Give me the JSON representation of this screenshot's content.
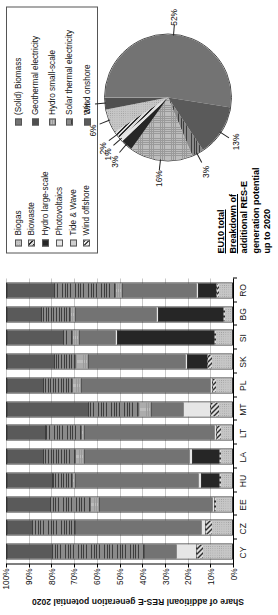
{
  "chart_data": [
    {
      "type": "bar",
      "subtype": "stacked-percentage-column",
      "title": "",
      "xlabel": "",
      "ylabel": "Share of additioanl RES-E generation potential 2020",
      "ylim": [
        0,
        100
      ],
      "ytick_labels": [
        "0%",
        "10%",
        "20%",
        "30%",
        "40%",
        "50%",
        "60%",
        "70%",
        "80%",
        "90%",
        "100%"
      ],
      "ytick_values": [
        0,
        10,
        20,
        30,
        40,
        50,
        60,
        70,
        80,
        90,
        100
      ],
      "grid": true,
      "legend_position": "top-right",
      "categories": [
        "CY",
        "CZ",
        "EE",
        "HU",
        "LA",
        "LT",
        "MT",
        "PL",
        "SK",
        "SI",
        "BG",
        "RO"
      ],
      "series": [
        {
          "name": "Biogas",
          "values": [
            13,
            9,
            7,
            5,
            5,
            5,
            6,
            7,
            9,
            7,
            3,
            6
          ]
        },
        {
          "name": "Biowaste",
          "values": [
            3,
            3,
            1,
            1,
            1,
            2,
            4,
            2,
            2,
            1,
            1,
            1
          ]
        },
        {
          "name": "Hydro large-scale",
          "values": [
            0,
            0,
            0,
            8,
            12,
            0,
            0,
            0,
            9,
            43,
            29,
            8
          ]
        },
        {
          "name": "Photovoltaics",
          "values": [
            9,
            2,
            1,
            1,
            1,
            1,
            12,
            1,
            1,
            1,
            1,
            1
          ]
        },
        {
          "name": "Tide & Wave",
          "values": [
            0,
            0,
            0,
            0,
            0,
            0,
            0,
            0,
            0,
            0,
            0,
            0
          ]
        },
        {
          "name": "Wind offshore",
          "values": [
            0,
            0,
            0,
            0,
            0,
            0,
            0,
            0,
            0,
            0,
            0,
            0
          ]
        },
        {
          "name": "(Solid) Biomass",
          "values": [
            14,
            56,
            50,
            55,
            47,
            58,
            14,
            57,
            43,
            16,
            36,
            33
          ]
        },
        {
          "name": "Geothermal electricity",
          "values": [
            0,
            0,
            0,
            0,
            0,
            0,
            0,
            0,
            0,
            0,
            0,
            0
          ]
        },
        {
          "name": "Hydro small-scale",
          "values": [
            0,
            0,
            4,
            1,
            4,
            1,
            6,
            4,
            6,
            3,
            2,
            3
          ]
        },
        {
          "name": "Solar thermal electricity",
          "values": [
            41,
            19,
            18,
            9,
            14,
            16,
            22,
            13,
            9,
            4,
            13,
            27
          ]
        },
        {
          "name": "Wind onshore",
          "values": [
            20,
            11,
            19,
            20,
            16,
            17,
            36,
            16,
            21,
            25,
            15,
            21
          ]
        }
      ]
    },
    {
      "type": "pie",
      "title_line1": "EU10 total",
      "title_line2": "Breakdown of",
      "title_line3": "additional RES-E",
      "title_line4": "generation potential",
      "title_line5": "up to 2020",
      "labels": [
        "(Solid) Biomass",
        "Wind onshore",
        "Solar thermal electricity",
        "Hydro small-scale",
        "Hydro large-scale",
        "Photovoltaics",
        "Biowaste",
        "Biogas",
        "Geothermal electricity"
      ],
      "values": [
        52,
        13,
        3,
        16,
        3,
        1,
        2,
        6,
        3
      ],
      "value_labels": [
        "52%",
        "13%",
        "3%",
        "16%",
        "3%",
        "1%",
        "2%",
        "6%",
        "3%"
      ]
    }
  ],
  "bar_chart": {
    "ylabel": "Share of additioanl RES-E generation potential 2020",
    "yticks": [
      "100%",
      "90%",
      "80%",
      "70%",
      "60%",
      "50%",
      "40%",
      "30%",
      "20%",
      "10%",
      "0%"
    ],
    "countries": [
      "CY",
      "CZ",
      "EE",
      "HU",
      "LA",
      "LT",
      "MT",
      "PL",
      "SK",
      "SI",
      "BG",
      "RO"
    ]
  },
  "legend": {
    "column1": [
      {
        "label": "Biogas",
        "pattern": "light-gray-dots"
      },
      {
        "label": "Biowaste",
        "pattern": "dark-diagonal-hatch"
      },
      {
        "label": "Hydro large-scale",
        "pattern": "solid-black"
      },
      {
        "label": "Photovoltaics",
        "pattern": "very-light-gray"
      },
      {
        "label": "Tide & Wave",
        "pattern": "light-gray"
      },
      {
        "label": "Wind offshore",
        "pattern": "fine-diagonal-hatch"
      }
    ],
    "column2": [
      {
        "label": "(Solid) Biomass",
        "pattern": "medium-gray"
      },
      {
        "label": "Geothermal electricity",
        "pattern": "dark-gray"
      },
      {
        "label": "Hydro small-scale",
        "pattern": "gray-checker"
      },
      {
        "label": "Solar thermal electricity",
        "pattern": "horizontal-lines"
      },
      {
        "label": "Wind onshore",
        "pattern": "dark-slate"
      }
    ]
  },
  "pie_chart": {
    "title": {
      "eu10": "EU10 total",
      "line1": "Breakdown of",
      "line2": "additional RES-E",
      "line3": "generation potential",
      "line4": "up to 2020"
    },
    "callouts": [
      "52%",
      "13%",
      "3%",
      "16%",
      "3%",
      "1%",
      "2%",
      "6%",
      "3%"
    ]
  },
  "colors": {
    "biogas": "#c9c9c9",
    "biowaste": "#4a4a4a",
    "hydro_large": "#2a2a2a",
    "photovoltaics": "#e0e0e0",
    "tide_wave": "#cfcfcf",
    "wind_offshore": "#d8d8d8",
    "solid_biomass": "#6e6e6e",
    "geothermal": "#555555",
    "hydro_small": "#b5b5b5",
    "solar_thermal": "#707070",
    "wind_onshore": "#5c5c5c",
    "grid": "#c9c9c9",
    "axis": "#000000"
  }
}
